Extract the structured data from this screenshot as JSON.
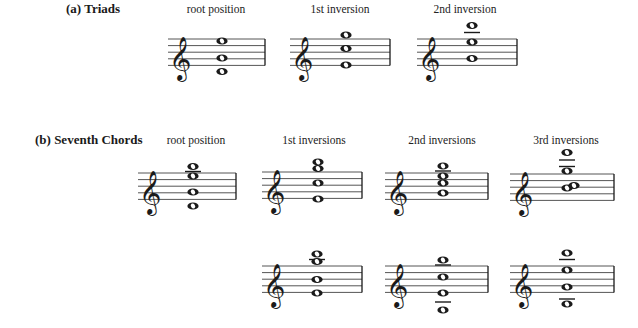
{
  "sections": [
    {
      "label": "(a) Triads",
      "label_pos": {
        "x": 66,
        "y": 1
      },
      "columns": [
        {
          "label": "root position",
          "x": 216,
          "y": 3
        },
        {
          "label": "1st inversion",
          "x": 340,
          "y": 3
        },
        {
          "label": "2nd inversion",
          "x": 465,
          "y": 3
        }
      ]
    },
    {
      "label": "(b) Seventh Chords",
      "label_pos": {
        "x": 35,
        "y": 132
      },
      "columns": [
        {
          "label": "root position",
          "x": 196,
          "y": 134
        },
        {
          "label": "1st inversions",
          "x": 314,
          "y": 134
        },
        {
          "label": "2nd inversions",
          "x": 442,
          "y": 134
        },
        {
          "label": "3rd inversions",
          "x": 566,
          "y": 134
        }
      ]
    }
  ],
  "staves": [
    {
      "name": "triad-root",
      "x1": 168,
      "x2": 265,
      "top": 39,
      "notes": [
        {
          "x": 222,
          "y": 41
        },
        {
          "x": 222,
          "y": 58
        },
        {
          "x": 222,
          "y": 71.5
        }
      ],
      "ledgers": []
    },
    {
      "name": "triad-1st",
      "x1": 290,
      "x2": 390,
      "top": 39,
      "notes": [
        {
          "x": 346,
          "y": 35
        },
        {
          "x": 346,
          "y": 48.5
        },
        {
          "x": 346,
          "y": 65
        }
      ],
      "ledgers": []
    },
    {
      "name": "triad-2nd",
      "x1": 417,
      "x2": 517,
      "top": 39,
      "notes": [
        {
          "x": 472,
          "y": 25.5
        },
        {
          "x": 472,
          "y": 42
        },
        {
          "x": 472,
          "y": 58.5
        }
      ],
      "ledgers": [
        {
          "x": 472,
          "y": 32.5
        }
      ]
    },
    {
      "name": "seventh-root",
      "x1": 138,
      "x2": 236,
      "top": 173,
      "notes": [
        {
          "x": 193,
          "y": 166.5
        },
        {
          "x": 193,
          "y": 176
        },
        {
          "x": 193,
          "y": 192
        },
        {
          "x": 193,
          "y": 206
        }
      ],
      "ledgers": [
        {
          "x": 193,
          "y": 166.5,
          "under": true
        }
      ]
    },
    {
      "name": "seventh-1st-a",
      "x1": 262,
      "x2": 362,
      "top": 172,
      "notes": [
        {
          "x": 318,
          "y": 162
        },
        {
          "x": 318,
          "y": 168.5
        },
        {
          "x": 318,
          "y": 183
        },
        {
          "x": 318,
          "y": 199
        }
      ],
      "ledgers": []
    },
    {
      "name": "seventh-2nd-a",
      "x1": 385,
      "x2": 488,
      "top": 173,
      "notes": [
        {
          "x": 443,
          "y": 166
        },
        {
          "x": 443,
          "y": 176
        },
        {
          "x": 443,
          "y": 183
        },
        {
          "x": 443,
          "y": 193
        }
      ],
      "ledgers": [
        {
          "x": 443,
          "y": 166,
          "under": true
        }
      ]
    },
    {
      "name": "seventh-3rd-a",
      "x1": 510,
      "x2": 614,
      "top": 174,
      "notes": [
        {
          "x": 567,
          "y": 152.5
        },
        {
          "x": 567,
          "y": 171
        },
        {
          "x": 567,
          "y": 188
        },
        {
          "x": 574,
          "y": 185.5
        }
      ],
      "ledgers": [
        {
          "x": 567,
          "y": 160
        },
        {
          "x": 567,
          "y": 166.5
        }
      ]
    },
    {
      "name": "seventh-1st-b",
      "x1": 262,
      "x2": 362,
      "top": 266,
      "notes": [
        {
          "x": 317,
          "y": 254
        },
        {
          "x": 317,
          "y": 261.5
        },
        {
          "x": 317,
          "y": 279.5
        },
        {
          "x": 317,
          "y": 293
        }
      ],
      "ledgers": [
        {
          "x": 317,
          "y": 259.5
        }
      ]
    },
    {
      "name": "seventh-2nd-b",
      "x1": 385,
      "x2": 488,
      "top": 266,
      "notes": [
        {
          "x": 443,
          "y": 260
        },
        {
          "x": 443,
          "y": 277
        },
        {
          "x": 443,
          "y": 293
        },
        {
          "x": 443,
          "y": 310
        }
      ],
      "ledgers": [
        {
          "x": 443,
          "y": 260,
          "under": true
        },
        {
          "x": 443,
          "y": 302
        }
      ]
    },
    {
      "name": "seventh-3rd-b",
      "x1": 510,
      "x2": 614,
      "top": 266,
      "notes": [
        {
          "x": 567,
          "y": 253
        },
        {
          "x": 567,
          "y": 270
        },
        {
          "x": 567,
          "y": 287
        },
        {
          "x": 567,
          "y": 304
        }
      ],
      "ledgers": [
        {
          "x": 567,
          "y": 259.5
        },
        {
          "x": 567,
          "y": 299
        }
      ]
    }
  ],
  "style": {
    "ink": "#1a1a1a",
    "staff_line": "#555555",
    "line_spacing": 6.6
  }
}
